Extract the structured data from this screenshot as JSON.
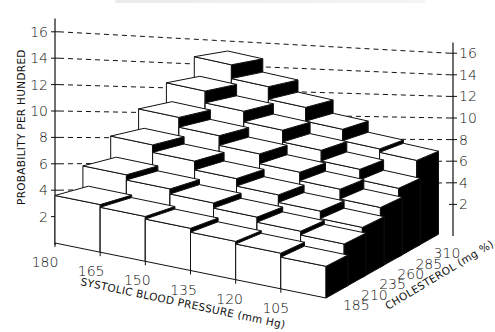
{
  "chart_data": {
    "type": "bar3d",
    "title": "",
    "zlabel": "PROBABILITY PER HUNDRED",
    "xlabel": "SYSTOLIC BLOOD PRESSURE (mm Hg)",
    "ylabel": "CHOLESTEROL (mg %)",
    "x_categories": [
      "180",
      "165",
      "150",
      "135",
      "120",
      "105"
    ],
    "y_categories": [
      "185",
      "210",
      "235",
      "260",
      "285",
      "310"
    ],
    "z_ticks_left": [
      "2",
      "4",
      "6",
      "8",
      "10",
      "12",
      "14",
      "16"
    ],
    "z_ticks_right": [
      "2",
      "4",
      "6",
      "8",
      "10",
      "12",
      "14",
      "16"
    ],
    "zlim": [
      0,
      16
    ],
    "grid": "dashed horizontal guide lines from 4 to 16",
    "corner_values": {
      "bp180_chol185": 3.6,
      "bp105_chol185": 2.4,
      "bp180_chol310": 12.3,
      "bp105_chol310": 7.5
    },
    "values": [
      [
        3.6,
        3.4,
        3.2,
        2.9,
        2.7,
        2.4
      ],
      [
        5.3,
        4.9,
        4.5,
        4.1,
        3.7,
        3.4
      ],
      [
        7.1,
        6.5,
        5.8,
        5.2,
        4.6,
        4.0
      ],
      [
        8.8,
        8.0,
        7.2,
        6.4,
        5.7,
        4.9
      ],
      [
        10.5,
        9.5,
        8.6,
        7.6,
        6.7,
        5.8
      ],
      [
        12.3,
        11.1,
        10.0,
        8.8,
        7.8,
        7.5
      ]
    ],
    "values_note": "rows = cholesterol 185..310, columns = systolic BP 180..105; estimated from bar heights"
  },
  "labels": {
    "y_axis_title": "PROBABILITY PER HUNDRED",
    "x_axis_title": "SYSTOLIC BLOOD PRESSURE (mm Hg)",
    "chol_axis_title": "CHOLESTEROL (mg %)"
  },
  "colors": {
    "face_front": "#ffffff",
    "face_top": "#ffffff",
    "face_side": "#000000",
    "line": "#111111"
  }
}
